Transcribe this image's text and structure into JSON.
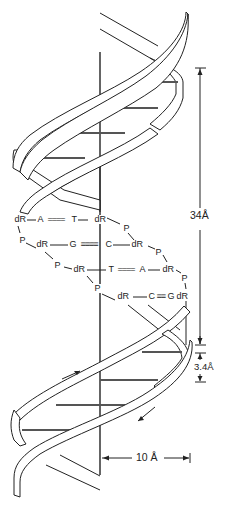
{
  "figure": {
    "colors": {
      "line": "#222222",
      "background": "#ffffff"
    }
  },
  "dimensions": {
    "pitch": "34Å",
    "rise": "3.4Å",
    "radius": "10 Å"
  },
  "pairs": [
    {
      "left_sugar": "dR",
      "left_base": "A",
      "bond": "====",
      "right_base": "T",
      "right_sugar": "dR"
    },
    {
      "left_sugar": "dR",
      "left_base": "G",
      "bond": "≡≡≡≡",
      "right_base": "C",
      "right_sugar": "dR"
    },
    {
      "left_sugar": "dR",
      "left_base": "T",
      "bond": "====",
      "right_base": "A",
      "right_sugar": "dR"
    },
    {
      "left_sugar": "dR",
      "left_base": "C",
      "bond": "≡≡",
      "right_base": "G",
      "right_sugar": "dR"
    }
  ],
  "labels": {
    "dR": "dR",
    "P": "P",
    "A": "A",
    "T": "T",
    "G": "G",
    "C": "C"
  }
}
